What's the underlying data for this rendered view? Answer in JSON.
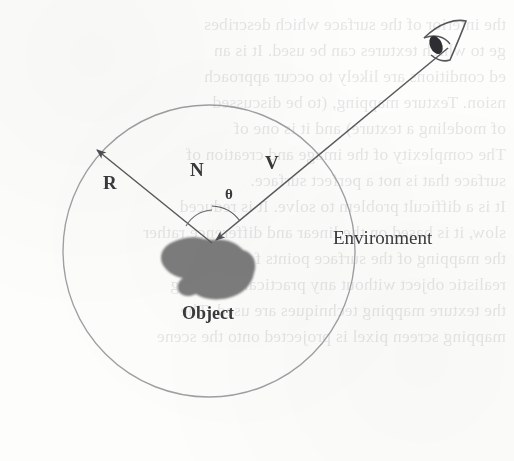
{
  "figure": {
    "kind": "diagram",
    "labels": {
      "environment": "Environment",
      "object": "Object",
      "reflection_vector": "R",
      "normal_vector": "N",
      "view_vector": "V",
      "angle": "θ"
    },
    "icons": {
      "eye": "eye-icon"
    },
    "colors": {
      "page": "#fdfdfc",
      "ink": "#3a3a3d",
      "circle_stroke": "#9a9a9e",
      "vector_stroke": "#5a5a5e",
      "object_fill": "#7c7c7c",
      "bleed_text": "#2b2b33"
    },
    "geometry": {
      "circle_center_x": 209,
      "circle_center_y": 251,
      "circle_radius": 146,
      "surface_point_x": 212,
      "surface_point_y": 243,
      "eye_x": 448,
      "eye_y": 44
    }
  },
  "bleed_text": {
    "note": "faint mirrored show-through from the reverse side of the scanned page",
    "lines": [
      "the interior of the surface which describes",
      "ge to which textures can be used. It is an",
      "ed conditions are likely to occur approach",
      "nsion. Texture mapping, (to be discussed",
      "of modeling a texture) and it is one of",
      "The complexity of the image and creation of",
      "surface that is not a perfect surface.",
      "It is a difficult problem to solve. It is reduced",
      "slow, it is based on the linear and difference rather",
      "the mapping of the surface points for a piece of",
      "realistic object without any practical rendering",
      "the texture mapping techniques are used. The",
      "mapping screen pixel is projected onto the scene"
    ]
  }
}
